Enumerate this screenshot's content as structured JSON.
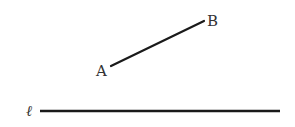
{
  "diagram": {
    "segment": {
      "label_start": "A",
      "label_end": "B",
      "start": [
        111,
        66
      ],
      "end": [
        204,
        21
      ]
    },
    "line": {
      "label": "ℓ",
      "start": [
        40,
        111
      ],
      "end": [
        280,
        111
      ]
    },
    "stroke_color": "#1a1a1a"
  }
}
